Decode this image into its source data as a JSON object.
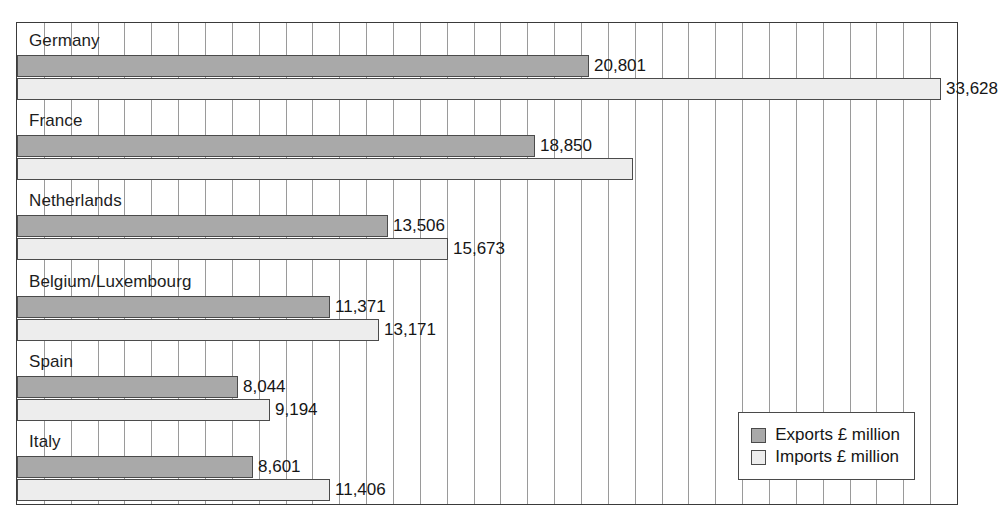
{
  "caption_fragment": "",
  "colors": {
    "exports_fill": "#a9a9a9",
    "imports_fill": "#ededed",
    "border": "#4a4a4a",
    "gridline": "#9a9a9a",
    "plot_border": "#3a3a3a",
    "text": "#161616",
    "background": "#ffffff"
  },
  "legend": {
    "exports_label": "Exports £ million",
    "imports_label": "Imports £ million"
  },
  "chart_data": {
    "type": "bar",
    "orientation": "horizontal",
    "title": "",
    "subtitle": "",
    "xlabel": "",
    "ylabel": "",
    "grid": true,
    "grid_axis": "x",
    "gridline_count": 34,
    "legend_position": "bottom-right",
    "xlim": [
      0,
      34200
    ],
    "categories": [
      "Germany",
      "France",
      "Netherlands",
      "Belgium/Luxembourg",
      "Spain",
      "Italy"
    ],
    "series": [
      {
        "name": "Exports £ million",
        "color": "#a9a9a9",
        "values": [
          20801,
          18850,
          13506,
          11371,
          8044,
          8601
        ],
        "labels": [
          "20,801",
          "18,850",
          "13,506",
          "11,371",
          "8,044",
          "8,601"
        ]
      },
      {
        "name": "Imports £ million",
        "color": "#ededed",
        "values": [
          33628,
          22420,
          15673,
          13171,
          9194,
          11406
        ],
        "labels": [
          "33,628",
          "",
          "15,673",
          "13,171",
          "9,194",
          "11,406"
        ]
      }
    ]
  }
}
